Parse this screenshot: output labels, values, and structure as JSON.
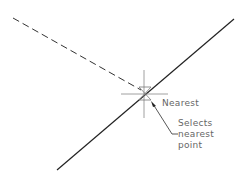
{
  "diagram": {
    "labels": {
      "snap_name": "Nearest",
      "description_line1": "Selects",
      "description_line2": "nearest",
      "description_line3": "point"
    },
    "colors": {
      "line": "#222222",
      "crosshair": "#888888",
      "text": "#666666",
      "background": "#ffffff"
    },
    "elements": {
      "dashed_line": {
        "x1": 13,
        "y1": 18,
        "x2": 140,
        "y2": 90
      },
      "solid_line": {
        "x1": 57,
        "y1": 170,
        "x2": 234,
        "y2": 19
      },
      "crosshair_center": {
        "x": 144,
        "y": 94
      }
    }
  }
}
